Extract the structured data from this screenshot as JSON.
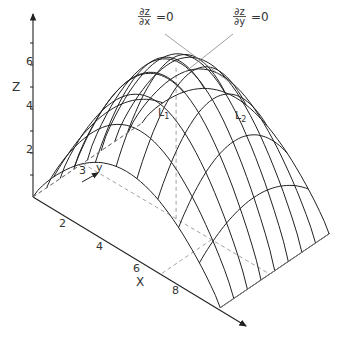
{
  "figure": {
    "z_axis": {
      "label": "Z",
      "ticks": [
        "2",
        "4",
        "6"
      ]
    },
    "x_axis": {
      "label": "X",
      "ticks": [
        "2",
        "4",
        "6",
        "8"
      ]
    },
    "y_axis": {
      "label": "y",
      "ticks": [
        "3"
      ]
    },
    "curve_labels": {
      "l1": "L",
      "l1_sub": "1",
      "l2": "L",
      "l2_sub": "2"
    },
    "annotations": {
      "dzdx": {
        "num": "∂z",
        "den": "∂x",
        "eq": "=0"
      },
      "dzdy": {
        "num": "∂z",
        "den": "∂y",
        "eq": "=0"
      }
    },
    "colors": {
      "line": "#222222",
      "dashed": "#999999",
      "annotation_line": "#888888"
    }
  },
  "chart_data": {
    "type": "surface",
    "title": "",
    "xlabel": "X",
    "ylabel": "y",
    "zlabel": "Z",
    "x_ticks": [
      2,
      4,
      6,
      8
    ],
    "y_ticks": [
      3
    ],
    "z_ticks": [
      2,
      4,
      6
    ],
    "x_range": [
      0,
      9
    ],
    "y_range": [
      0,
      6
    ],
    "z_range": [
      0,
      7
    ],
    "peak": {
      "x": 4.5,
      "y": 3,
      "z": 6.8
    },
    "annotations": [
      "∂z/∂x = 0",
      "∂z/∂y = 0",
      "L1",
      "L2"
    ]
  }
}
